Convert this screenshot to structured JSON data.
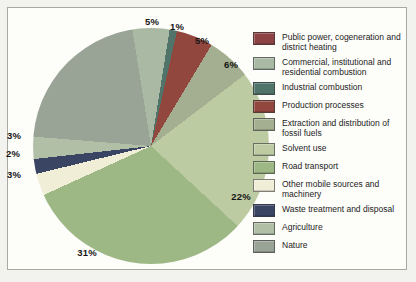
{
  "chart_data": {
    "type": "pie",
    "title": "",
    "legend_position": "right",
    "start_angle_deg": -9.09,
    "slices": [
      {
        "label": "Public power, cogeneration and\ndistrict heating",
        "pct": 0,
        "display": "",
        "color": "#8d4343"
      },
      {
        "label": "Commercial, institutional and\nresidential combustion",
        "pct": 5,
        "display": "5%",
        "color": "#a9b9a3"
      },
      {
        "label": "Industrial combustion",
        "pct": 1,
        "display": "1%",
        "color": "#51746a"
      },
      {
        "label": "Production processes",
        "pct": 5,
        "display": "5%",
        "color": "#91463e"
      },
      {
        "label": "Extraction and distribution of\nfossil fuels",
        "pct": 6,
        "display": "6%",
        "color": "#a3af90"
      },
      {
        "label": "Solvent use",
        "pct": 22,
        "display": "22%",
        "color": "#bdcba2"
      },
      {
        "label": "Road transport",
        "pct": 31,
        "display": "31%",
        "color": "#9db885"
      },
      {
        "label": "Other mobile sources and\nmachinery",
        "pct": 3,
        "display": "3%",
        "color": "#f0eed7"
      },
      {
        "label": "Waste treatment and disposal",
        "pct": 2,
        "display": "2%",
        "color": "#3a4563"
      },
      {
        "label": "Agriculture",
        "pct": 3,
        "display": "3%",
        "color": "#b2bfa7"
      },
      {
        "label": "Nature",
        "pct": 21,
        "display": "21%",
        "color": "#99a396"
      }
    ],
    "point_labels": [
      {
        "text": "5%",
        "x": 152,
        "y": 21
      },
      {
        "text": "1%",
        "x": 177,
        "y": 26
      },
      {
        "text": "5%",
        "x": 202,
        "y": 40
      },
      {
        "text": "6%",
        "x": 231,
        "y": 64
      },
      {
        "text": "22%",
        "x": 241,
        "y": 196
      },
      {
        "text": "31%",
        "x": 87,
        "y": 252
      },
      {
        "text": "3%",
        "x": 14,
        "y": 135
      },
      {
        "text": "2%",
        "x": 13,
        "y": 153
      },
      {
        "text": "3%",
        "x": 14,
        "y": 174
      }
    ]
  }
}
